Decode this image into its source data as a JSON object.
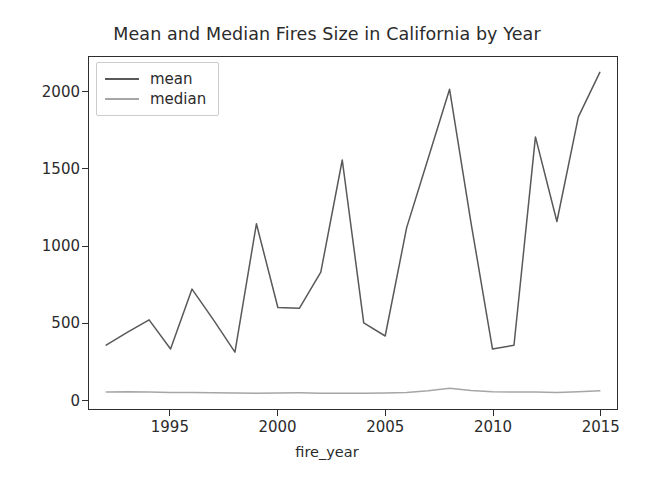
{
  "chart_data": {
    "type": "line",
    "title": "Mean and Median Fires Size in California by Year",
    "xlabel": "fire_year",
    "ylabel": "",
    "grid": false,
    "legend_position": "upper left",
    "xlim": [
      1991.2,
      2015.8
    ],
    "ylim": [
      -60,
      2230
    ],
    "x": [
      1992,
      1993,
      1994,
      1995,
      1996,
      1997,
      1998,
      1999,
      2000,
      2001,
      2002,
      2003,
      2004,
      2005,
      2006,
      2007,
      2008,
      2009,
      2010,
      2011,
      2012,
      2013,
      2014,
      2015
    ],
    "xticks": [
      1995,
      2000,
      2005,
      2010,
      2015
    ],
    "xticklabels": [
      "1995",
      "2000",
      "2005",
      "2010",
      "2015"
    ],
    "yticks": [
      0,
      500,
      1000,
      1500,
      2000
    ],
    "yticklabels": [
      "0",
      "500",
      "1000",
      "1500",
      "2000"
    ],
    "series": [
      {
        "name": "mean",
        "color": "#595959",
        "values": [
          355,
          440,
          520,
          330,
          720,
          520,
          310,
          1145,
          600,
          595,
          830,
          1560,
          500,
          415,
          1120,
          1570,
          2020,
          1150,
          330,
          355,
          1710,
          1160,
          1840,
          2130
        ]
      },
      {
        "name": "median",
        "color": "#a6a6a6",
        "values": [
          50,
          52,
          50,
          48,
          47,
          45,
          44,
          43,
          44,
          45,
          43,
          42,
          42,
          44,
          48,
          58,
          75,
          60,
          52,
          50,
          50,
          48,
          52,
          58
        ]
      }
    ]
  },
  "legend": {
    "entries": [
      {
        "label": "mean"
      },
      {
        "label": "median"
      }
    ]
  },
  "colors": {
    "axis": "#2e2e2e",
    "text": "#2b2b2b",
    "mean_line": "#595959",
    "median_line": "#a6a6a6",
    "background": "#ffffff"
  }
}
